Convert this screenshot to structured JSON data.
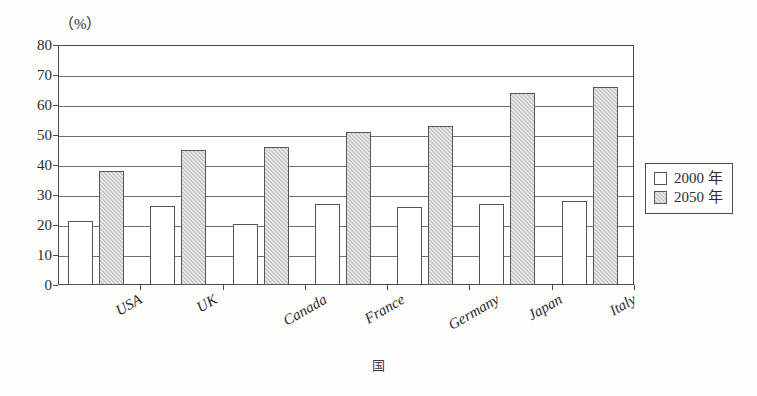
{
  "unit_label": "（%）",
  "x_axis_title": "国",
  "legend": {
    "position": "right",
    "items": [
      {
        "label": "2000 年",
        "swatch": "white"
      },
      {
        "label": "2050 年",
        "swatch": "gray"
      }
    ]
  },
  "colors": {
    "series_2000": "#ffffff",
    "series_2050": "#c9c9c9",
    "axis": "#4a4a4a",
    "gridline": "#6f6f6f",
    "text": "#2b2b2b"
  },
  "chart_data": {
    "type": "bar",
    "title": "",
    "subtitle": "",
    "xlabel": "国",
    "ylabel": "（%）",
    "ylim": [
      0,
      80
    ],
    "yticks": [
      0,
      10,
      20,
      30,
      40,
      50,
      60,
      70,
      80
    ],
    "ytick_labels": [
      "0",
      "10",
      "20",
      "30",
      "40",
      "50",
      "60",
      "70",
      "80"
    ],
    "grid": true,
    "legend_position": "right",
    "categories": [
      "USA",
      "UK",
      "Canada",
      "France",
      "Germany",
      "Japan",
      "Italy"
    ],
    "series": [
      {
        "name": "2000 年",
        "values": [
          21.5,
          26.5,
          20.5,
          27,
          26,
          27,
          28
        ]
      },
      {
        "name": "2050 年",
        "values": [
          38,
          45,
          46,
          51,
          53,
          64,
          66
        ]
      }
    ]
  }
}
